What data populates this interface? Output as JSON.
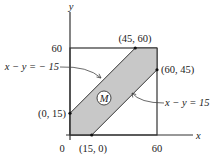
{
  "diagram": {
    "axes": {
      "x_label": "x",
      "y_label": "y",
      "origin_label": "0",
      "x_tick": "60",
      "y_tick": "60"
    },
    "region": {
      "label": "M",
      "fill_color": "#c8c8c8",
      "vertices": [
        [
          0,
          0
        ],
        [
          15,
          0
        ],
        [
          60,
          45
        ],
        [
          60,
          60
        ],
        [
          45,
          60
        ],
        [
          0,
          15
        ]
      ]
    },
    "points": [
      {
        "label": "(0, 15)",
        "x": 0,
        "y": 15
      },
      {
        "label": "(15, 0)",
        "x": 15,
        "y": 0
      },
      {
        "label": "(45, 60)",
        "x": 45,
        "y": 60
      },
      {
        "label": "(60, 45)",
        "x": 60,
        "y": 45
      }
    ],
    "lines": [
      {
        "label": "x − y = − 15"
      },
      {
        "label": "x − y = 15"
      }
    ]
  }
}
